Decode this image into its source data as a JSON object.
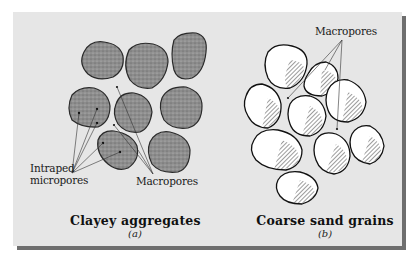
{
  "figure": {
    "background_color": "#e6e6e6",
    "shadow_color": "#6e6e6e",
    "panels": [
      {
        "id": "a",
        "caption": "Clayey aggregates",
        "sublabel": "(a)",
        "labels": {
          "intraped_line1": "Intraped",
          "intraped_line2": "micropores",
          "macropores": "Macropores"
        },
        "element_type": "clay aggregate (stippled gray)",
        "element_count": 9,
        "fill_color": "#8a8a8a"
      },
      {
        "id": "b",
        "caption": "Coarse sand grains",
        "sublabel": "(b)",
        "labels": {
          "macropores": "Macropores"
        },
        "element_type": "sand grain (white, hatched shading)",
        "element_count": 10,
        "fill_color": "#ffffff"
      }
    ]
  }
}
